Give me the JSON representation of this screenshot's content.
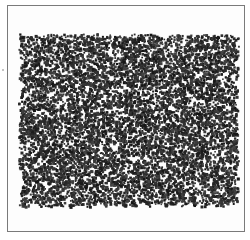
{
  "chart_data": {
    "type": "scatter",
    "title": "",
    "xlabel": "",
    "ylabel": "",
    "grid": false,
    "legend": null,
    "series": [
      {
        "name": "points",
        "color": "#1e1e1e",
        "marker": "square",
        "marker_size_px": 2.2,
        "count": 9000,
        "distribution": "uniform-random",
        "extent_px": {
          "x_min": 18,
          "x_max": 238,
          "y_min": 33,
          "y_max": 206
        }
      }
    ],
    "xlim": [
      0,
      1
    ],
    "ylim": [
      0,
      1
    ]
  },
  "frame": {
    "border_color": "#7a7a7a",
    "background": "#fdfdfd"
  }
}
